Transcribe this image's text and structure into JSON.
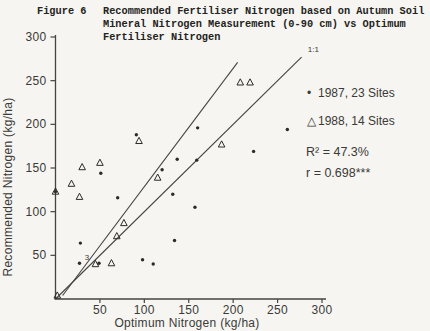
{
  "figure": {
    "label": "Figure 6",
    "title_lines": [
      "Recommended Fertiliser Nitrogen based on Autumn Soil",
      "Mineral Nitrogen Measurement (0-90 cm) vs Optimum",
      "Fertiliser Nitrogen"
    ]
  },
  "chart_data": {
    "type": "scatter",
    "xlabel": "Optimum Nitrogen (kg/ha)",
    "ylabel": "Recommended Nitrogen (kg/ha)",
    "xlim": [
      0,
      300
    ],
    "ylim": [
      0,
      300
    ],
    "xticks": [
      50,
      100,
      150,
      200,
      250,
      300
    ],
    "yticks": [
      50,
      100,
      150,
      200,
      250,
      300
    ],
    "grid": false,
    "legend_position": "right-inside",
    "marker_color": "#2b2b29",
    "line_color": "#45443f",
    "series": [
      {
        "name": "1987, 23 Sites",
        "marker": "dot",
        "legend_glyph": "•",
        "points": [
          [
            0,
            123
          ],
          [
            27,
            41
          ],
          [
            28,
            64
          ],
          [
            49,
            41
          ],
          [
            51,
            144
          ],
          [
            70,
            116
          ],
          [
            91,
            188
          ],
          [
            98,
            45
          ],
          [
            110,
            40
          ],
          [
            120,
            148
          ],
          [
            132,
            120
          ],
          [
            134,
            67
          ],
          [
            137,
            160
          ],
          [
            157,
            105
          ],
          [
            159,
            159
          ],
          [
            160,
            196
          ],
          [
            223,
            169
          ],
          [
            261,
            194
          ]
        ]
      },
      {
        "name": "1988, 14 Sites",
        "marker": "triangle",
        "legend_glyph": "△",
        "points": [
          [
            2,
            4
          ],
          [
            0,
            123
          ],
          [
            18,
            132
          ],
          [
            27,
            117
          ],
          [
            30,
            151
          ],
          [
            50,
            156
          ],
          [
            45,
            40
          ],
          [
            63,
            41
          ],
          [
            69,
            72
          ],
          [
            77,
            87
          ],
          [
            94,
            181
          ],
          [
            115,
            139
          ],
          [
            187,
            177
          ],
          [
            208,
            248
          ],
          [
            219,
            248
          ]
        ]
      }
    ],
    "lines": [
      {
        "name": "one-to-one-line",
        "label": "1:1",
        "x1": 0,
        "y1": 0,
        "x2": 277,
        "y2": 277
      },
      {
        "name": "regression-line",
        "label": "",
        "x1": 8,
        "y1": 4,
        "x2": 205,
        "y2": 271
      }
    ],
    "annotations": [
      {
        "name": "one-to-one-label",
        "text": "1:1",
        "x": 284,
        "y": 283
      },
      {
        "name": "cluster-count-label",
        "text": "3",
        "x": 33,
        "y": 45
      }
    ],
    "stats": {
      "r_squared": "R² = 47.3%",
      "r": "r = 0.698***"
    }
  }
}
